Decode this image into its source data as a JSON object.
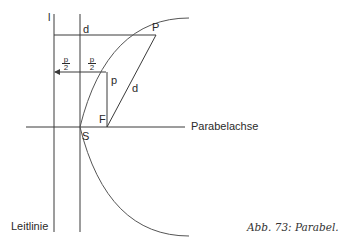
{
  "figure": {
    "caption": "Abb. 73: Parabel.",
    "labels": {
      "directrix_letter": "l",
      "top_distance": "d",
      "point_P": "P",
      "fraction_left_num": "p",
      "fraction_left_den": "2",
      "fraction_right_num": "p",
      "fraction_right_den": "2",
      "parameter_p": "p",
      "focal_distance": "d",
      "focus": "F",
      "vertex": "S",
      "axis": "Parabelachse",
      "directrix": "Leitlinie"
    },
    "colors": {
      "line": "#3a3a3a",
      "text": "#2a2a2a",
      "background": "#ffffff"
    }
  }
}
